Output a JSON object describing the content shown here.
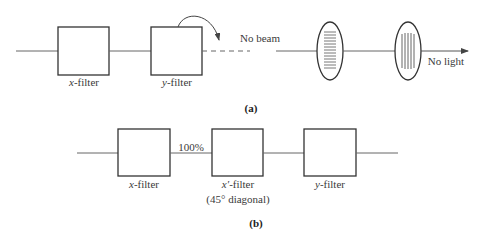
{
  "panel_a": {
    "caption": "(a)",
    "filters": [
      {
        "var": "x",
        "suffix": "-filter"
      },
      {
        "var": "y",
        "suffix": "-filter"
      }
    ],
    "after_y_filter_label": "No beam",
    "output_label": "No light",
    "polarizers": [
      {
        "orientation": "horizontal-lines"
      },
      {
        "orientation": "vertical-lines"
      }
    ]
  },
  "panel_b": {
    "caption": "(b)",
    "intensity_label": "100%",
    "filters": [
      {
        "var": "x",
        "suffix": "-filter",
        "note": ""
      },
      {
        "var": "x′",
        "suffix": "-filter",
        "note": "(45° diagonal)"
      },
      {
        "var": "y",
        "suffix": "-filter",
        "note": ""
      }
    ]
  },
  "colors": {
    "stroke": "#3a3a3a",
    "beam": "#555555"
  }
}
